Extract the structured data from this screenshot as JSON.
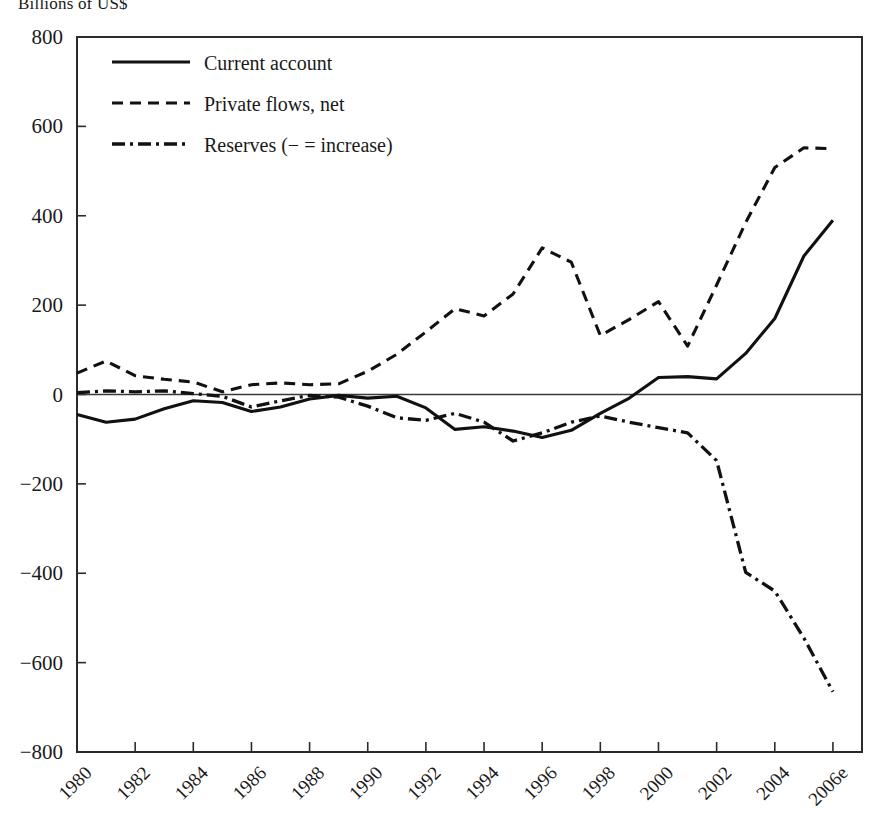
{
  "chart_data": {
    "type": "line",
    "title": "Billions of US$",
    "xlabel": "",
    "ylabel": "Billions of US$",
    "ylim": [
      -800,
      800
    ],
    "ytick_step": 200,
    "yticks": [
      "800",
      "600",
      "400",
      "200",
      "0",
      "−200",
      "−400",
      "−600",
      "−800"
    ],
    "grid": false,
    "legend_position": "top-left",
    "x": [
      1980,
      1981,
      1982,
      1983,
      1984,
      1985,
      1986,
      1987,
      1988,
      1989,
      1990,
      1991,
      1992,
      1993,
      1994,
      1995,
      1996,
      1997,
      1998,
      1999,
      2000,
      2001,
      2002,
      2003,
      2004,
      2005,
      2006
    ],
    "xtick_labels": [
      "1980",
      "1982",
      "1984",
      "1986",
      "1988",
      "1990",
      "1992",
      "1994",
      "1996",
      "1998",
      "2000",
      "2002",
      "2004",
      "2006e"
    ],
    "xtick_years": [
      1980,
      1982,
      1984,
      1986,
      1988,
      1990,
      1992,
      1994,
      1996,
      1998,
      2000,
      2002,
      2004,
      2006
    ],
    "series": [
      {
        "name": "Current account",
        "style": "solid",
        "values": [
          -45,
          -62,
          -55,
          -32,
          -14,
          -18,
          -38,
          -28,
          -10,
          -2,
          -8,
          -4,
          -30,
          -78,
          -72,
          -82,
          -96,
          -80,
          -42,
          -8,
          38,
          40,
          35,
          92,
          170,
          310,
          390
        ]
      },
      {
        "name": "Private flows, net",
        "style": "dashed",
        "values": [
          48,
          75,
          42,
          34,
          28,
          6,
          22,
          26,
          22,
          24,
          52,
          90,
          140,
          192,
          176,
          225,
          328,
          296,
          132,
          168,
          208,
          108,
          245,
          385,
          508,
          552,
          550
        ]
      },
      {
        "name": "Reserves (− = increase)",
        "style": "dashdot",
        "values": [
          4,
          8,
          6,
          8,
          2,
          -4,
          -28,
          -14,
          -2,
          -6,
          -26,
          -52,
          -58,
          -42,
          -62,
          -104,
          -86,
          -62,
          -48,
          -62,
          -74,
          -86,
          -148,
          -398,
          -440,
          -545,
          -665
        ]
      }
    ],
    "legend": [
      {
        "label": "Current account",
        "style": "solid"
      },
      {
        "label": "Private flows, net",
        "style": "dashed"
      },
      {
        "label": "Reserves (− = increase)",
        "style": "dashdot"
      }
    ]
  }
}
